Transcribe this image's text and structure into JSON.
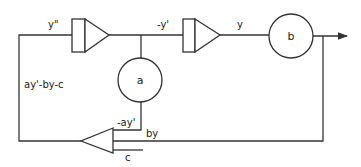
{
  "diagram": {
    "type": "analog-computer block diagram",
    "blocks": {
      "integrator1": {
        "kind": "integrator",
        "input_label": "y\"",
        "output_label": "-y'"
      },
      "integrator2": {
        "kind": "integrator",
        "output_label": "y"
      },
      "coef_a": {
        "kind": "coefficient-potentiometer",
        "label": "a",
        "output_label": "-ay'"
      },
      "coef_b": {
        "kind": "coefficient-potentiometer",
        "label": "b",
        "output_label": "by"
      },
      "summer": {
        "kind": "summing-amplifier",
        "inputs": [
          "-ay'",
          "by",
          "c"
        ],
        "output_label": "ay'-by-c"
      }
    },
    "labels": {
      "y_double_prime": "y\"",
      "neg_y_prime": "-y'",
      "y": "y",
      "a": "a",
      "b": "b",
      "neg_ay_prime": "-ay'",
      "by": "by",
      "c": "c",
      "feedback": "ay'-by-c"
    },
    "colors": {
      "line": "#333333",
      "background": "#ffffff"
    }
  }
}
